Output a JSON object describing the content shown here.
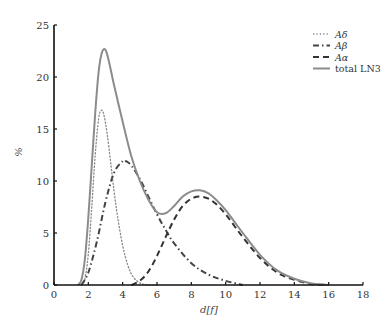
{
  "chart_data": {
    "type": "line",
    "title": "",
    "xlabel": "d[f]",
    "ylabel": "%",
    "xlim": [
      0,
      18
    ],
    "ylim": [
      0,
      25
    ],
    "xticks": [
      0,
      2,
      4,
      6,
      8,
      10,
      12,
      14,
      16,
      18
    ],
    "yticks": [
      0,
      5,
      10,
      15,
      20,
      25
    ],
    "grid": false,
    "legend_position": "upper right",
    "series": [
      {
        "name": "Aδ",
        "style": "dotted",
        "color": "#888888",
        "x": [
          1.6,
          1.8,
          2.0,
          2.2,
          2.4,
          2.6,
          2.75,
          2.9,
          3.1,
          3.3,
          3.5,
          3.7,
          4.0,
          4.3,
          4.6,
          5.0,
          5.5,
          6.0
        ],
        "y": [
          0.0,
          0.6,
          3.0,
          7.5,
          12.5,
          16.0,
          16.8,
          16.4,
          14.5,
          11.8,
          9.0,
          6.6,
          3.8,
          1.9,
          0.8,
          0.2,
          0.0,
          0.0
        ]
      },
      {
        "name": "Aβ",
        "style": "dashdot",
        "color": "#444444",
        "x": [
          1.6,
          2.0,
          2.5,
          3.0,
          3.5,
          4.0,
          4.2,
          4.5,
          5.0,
          5.5,
          6.0,
          6.5,
          7.0,
          8.0,
          9.0,
          10.0,
          11.0
        ],
        "y": [
          0.0,
          1.2,
          4.2,
          8.0,
          10.8,
          11.9,
          11.9,
          11.5,
          10.2,
          8.5,
          6.8,
          5.3,
          4.0,
          2.1,
          1.0,
          0.4,
          0.0
        ]
      },
      {
        "name": "Aα",
        "style": "dashed",
        "color": "#333333",
        "x": [
          4.5,
          5.0,
          5.5,
          6.0,
          6.5,
          7.0,
          7.5,
          8.0,
          8.5,
          9.0,
          9.5,
          10.0,
          10.5,
          11.0,
          12.0,
          13.0,
          14.0,
          15.0,
          16.0
        ],
        "y": [
          0.0,
          0.4,
          1.3,
          2.8,
          4.6,
          6.3,
          7.6,
          8.3,
          8.5,
          8.3,
          7.7,
          6.8,
          5.7,
          4.6,
          2.6,
          1.2,
          0.5,
          0.1,
          0.0
        ]
      },
      {
        "name": "total LN3",
        "style": "solid",
        "color": "#8c8c8c",
        "x": [
          1.4,
          1.6,
          1.8,
          2.0,
          2.2,
          2.4,
          2.6,
          2.8,
          3.0,
          3.2,
          3.5,
          4.0,
          4.5,
          5.0,
          5.5,
          6.0,
          6.5,
          7.0,
          7.5,
          8.0,
          8.5,
          9.0,
          9.5,
          10.0,
          10.5,
          11.0,
          12.0,
          13.0,
          14.0,
          15.0,
          16.0
        ],
        "y": [
          0.0,
          0.5,
          2.5,
          6.5,
          11.5,
          16.5,
          20.5,
          22.4,
          22.6,
          21.5,
          19.2,
          15.7,
          12.4,
          10.0,
          8.2,
          7.0,
          6.9,
          7.6,
          8.5,
          9.0,
          9.1,
          8.8,
          8.1,
          7.2,
          6.1,
          5.0,
          2.9,
          1.4,
          0.6,
          0.15,
          0.0
        ]
      }
    ]
  },
  "legend": {
    "items": [
      {
        "label": "Aδ",
        "style": "dotted"
      },
      {
        "label": "Aβ",
        "style": "dashdot"
      },
      {
        "label": "Aα",
        "style": "dashed"
      },
      {
        "label": "total LN3",
        "style": "solid"
      }
    ]
  },
  "axes": {
    "xlabel": "d[f]",
    "ylabel": "%"
  }
}
